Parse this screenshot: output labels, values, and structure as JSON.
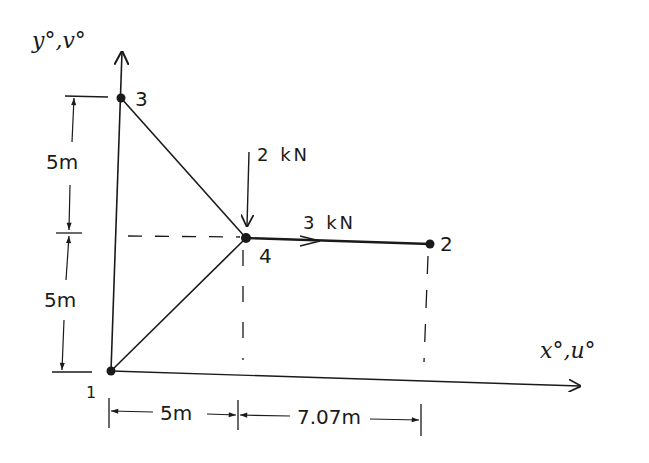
{
  "diagram": {
    "type": "plane truss with loads and dimensions",
    "axes": {
      "y_label": "y°,v°",
      "x_label": "x°,u°"
    },
    "nodes": [
      {
        "id": "1",
        "label": "1",
        "x": 111,
        "y": 371
      },
      {
        "id": "2",
        "label": "2",
        "x": 430,
        "y": 244
      },
      {
        "id": "3",
        "label": "3",
        "x": 121,
        "y": 98
      },
      {
        "id": "4",
        "label": "4",
        "x": 246,
        "y": 238
      }
    ],
    "members": [
      {
        "from": "1",
        "to": "3"
      },
      {
        "from": "3",
        "to": "4"
      },
      {
        "from": "1",
        "to": "4"
      },
      {
        "from": "4",
        "to": "2"
      }
    ],
    "loads": [
      {
        "node": "4",
        "label": "2 kN",
        "direction": "down"
      },
      {
        "node": "4",
        "label": "3 kN",
        "direction": "right"
      }
    ],
    "dimensions": {
      "vertical": [
        {
          "label": "5m",
          "segment": "upper"
        },
        {
          "label": "5m",
          "segment": "lower"
        }
      ],
      "horizontal": [
        {
          "label": "5m",
          "segment": "left"
        },
        {
          "label": "7.07m",
          "segment": "right"
        }
      ]
    }
  }
}
